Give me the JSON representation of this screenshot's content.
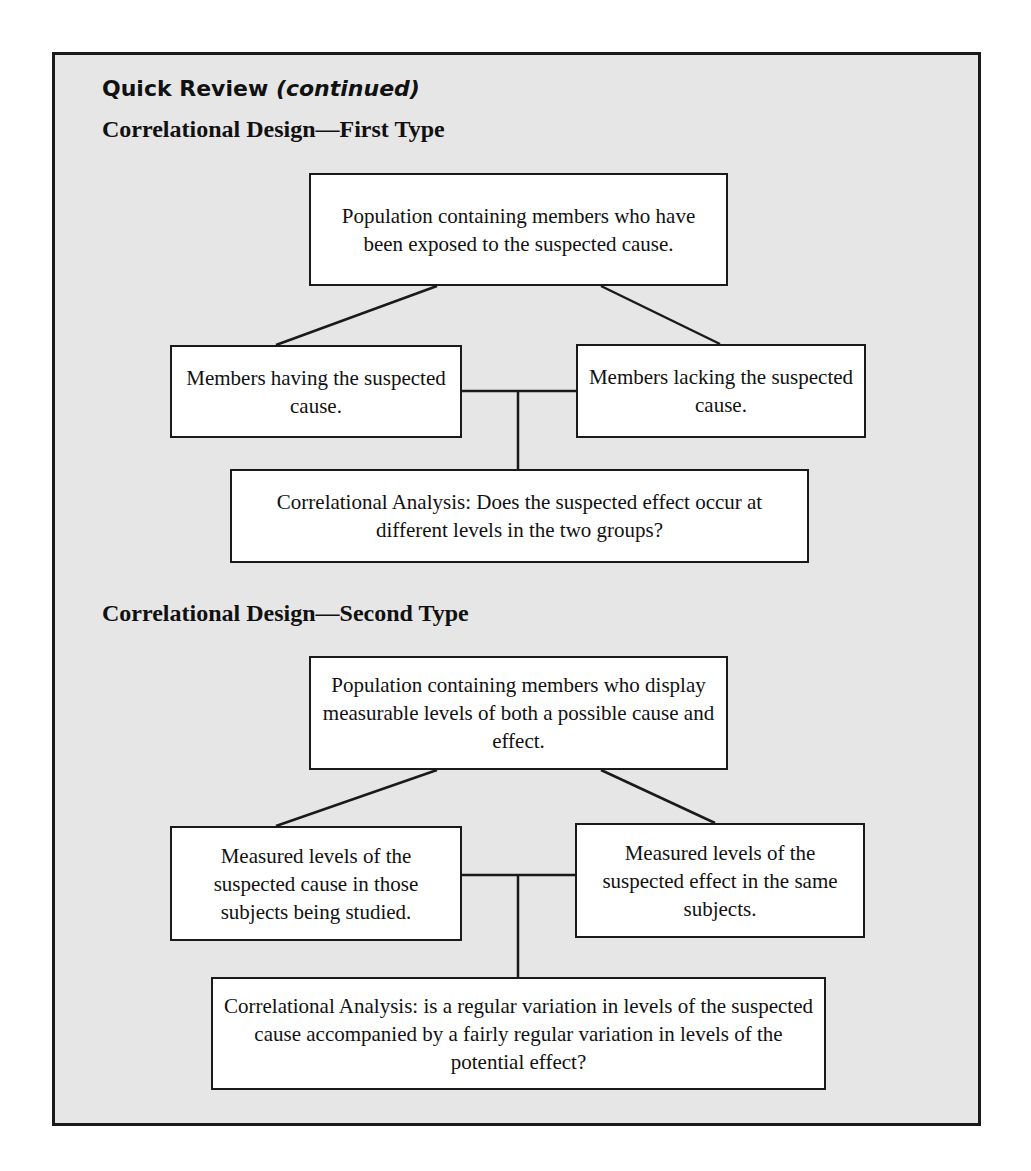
{
  "header": {
    "title": "Quick Review",
    "title_suffix": "(continued)"
  },
  "sections": [
    {
      "heading": "Correlational Design—First Type",
      "nodes": {
        "root": "Population containing members who have been exposed to the suspected cause.",
        "left": "Members having the suspected cause.",
        "right": "Members lacking the suspected cause.",
        "analysis": "Correlational Analysis: Does the suspected effect occur at different levels in the two groups?"
      }
    },
    {
      "heading": "Correlational Design—Second Type",
      "nodes": {
        "root": "Population containing members who display measurable levels of both a possible cause and effect.",
        "left": "Measured levels of the suspected cause in those subjects being studied.",
        "right": "Measured levels of the suspected effect in the same subjects.",
        "analysis": "Correlational Analysis: is a regular variation in levels of the suspected cause accompanied by a fairly regular variation in levels of the potential effect?"
      }
    }
  ],
  "colors": {
    "panel_background": "#e6e6e6",
    "box_background": "#ffffff",
    "stroke": "#1a1a1a"
  }
}
